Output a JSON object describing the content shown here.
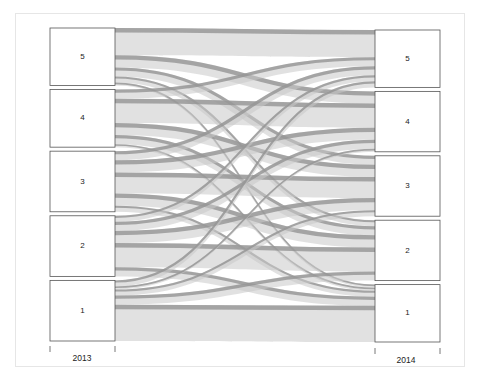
{
  "chart_data": {
    "type": "alluvial",
    "title": "",
    "axes": [
      {
        "label": "2013",
        "categories": [
          "5",
          "4",
          "3",
          "2",
          "1"
        ]
      },
      {
        "label": "2014",
        "categories": [
          "5",
          "4",
          "3",
          "2",
          "1"
        ]
      }
    ],
    "flow_order_note": "flows[i][j] = count moving from 2013 category i to 2014 category j, categories listed top to bottom",
    "from_categories": [
      "5",
      "4",
      "3",
      "2",
      "1"
    ],
    "to_categories": [
      "5",
      "4",
      "3",
      "2",
      "1"
    ],
    "flows": [
      [
        9,
        4,
        3,
        2,
        1
      ],
      [
        3,
        8,
        4,
        3,
        1
      ],
      [
        3,
        4,
        7,
        4,
        2
      ],
      [
        2,
        3,
        4,
        8,
        3
      ],
      [
        2,
        1,
        2,
        3,
        12
      ]
    ],
    "colors": {
      "flow_fill": "#c8c8c8",
      "flow_edge": "#8f8f8f",
      "node_stroke": "#555555",
      "node_fill": "#ffffff",
      "frame": "#e6e6e6"
    }
  }
}
